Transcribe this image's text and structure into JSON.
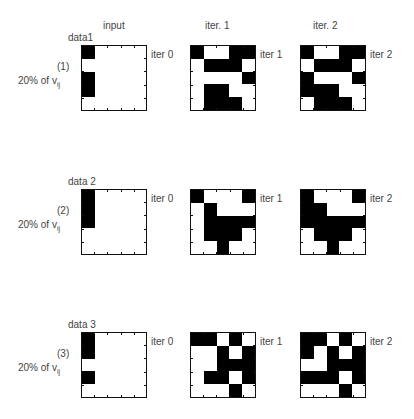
{
  "columns": {
    "input": "input",
    "iter1": "iter. 1",
    "iter2": "iter. 2"
  },
  "rows": [
    {
      "data_label": "data1",
      "case_label": "(1)",
      "percent_label": "20% of v",
      "percent_sub": "ij",
      "iter_labels": [
        "iter 0",
        "iter 1",
        "iter 2"
      ],
      "grids": [
        [
          [
            1,
            0,
            0,
            0,
            0
          ],
          [
            0,
            0,
            0,
            0,
            0
          ],
          [
            1,
            0,
            0,
            0,
            0
          ],
          [
            1,
            0,
            0,
            0,
            0
          ],
          [
            0,
            0,
            0,
            0,
            0
          ]
        ],
        [
          [
            1,
            0,
            0,
            1,
            1
          ],
          [
            0,
            1,
            1,
            1,
            0
          ],
          [
            0,
            0,
            0,
            0,
            1
          ],
          [
            0,
            1,
            1,
            0,
            0
          ],
          [
            0,
            1,
            1,
            1,
            0
          ]
        ],
        [
          [
            1,
            0,
            0,
            1,
            1
          ],
          [
            0,
            1,
            1,
            1,
            0
          ],
          [
            1,
            0,
            0,
            0,
            1
          ],
          [
            1,
            1,
            1,
            0,
            0
          ],
          [
            0,
            1,
            1,
            1,
            0
          ]
        ]
      ]
    },
    {
      "data_label": "data 2",
      "case_label": "(2)",
      "percent_label": "20% of v",
      "percent_sub": "ij",
      "iter_labels": [
        "iter 0",
        "iter 1",
        "iter 2"
      ],
      "grids": [
        [
          [
            1,
            0,
            0,
            0,
            0
          ],
          [
            1,
            0,
            0,
            0,
            0
          ],
          [
            1,
            0,
            0,
            0,
            0
          ],
          [
            0,
            0,
            0,
            0,
            0
          ],
          [
            0,
            0,
            0,
            0,
            0
          ]
        ],
        [
          [
            1,
            0,
            0,
            0,
            1
          ],
          [
            0,
            1,
            0,
            0,
            0
          ],
          [
            0,
            1,
            1,
            1,
            1
          ],
          [
            0,
            1,
            1,
            1,
            0
          ],
          [
            0,
            0,
            1,
            0,
            0
          ]
        ],
        [
          [
            1,
            0,
            0,
            0,
            1
          ],
          [
            1,
            1,
            0,
            0,
            0
          ],
          [
            1,
            1,
            1,
            1,
            1
          ],
          [
            0,
            1,
            1,
            1,
            0
          ],
          [
            0,
            0,
            1,
            0,
            0
          ]
        ]
      ]
    },
    {
      "data_label": "data 3",
      "case_label": "(3)",
      "percent_label": "20% of v",
      "percent_sub": "ij",
      "iter_labels": [
        "iter 0",
        "iter 1",
        "iter 2"
      ],
      "grids": [
        [
          [
            1,
            0,
            0,
            0,
            0
          ],
          [
            1,
            0,
            0,
            0,
            0
          ],
          [
            0,
            0,
            0,
            0,
            0
          ],
          [
            1,
            0,
            0,
            0,
            0
          ],
          [
            0,
            0,
            0,
            0,
            0
          ]
        ],
        [
          [
            1,
            1,
            0,
            1,
            0
          ],
          [
            0,
            0,
            1,
            0,
            1
          ],
          [
            0,
            0,
            1,
            1,
            1
          ],
          [
            0,
            1,
            1,
            0,
            1
          ],
          [
            0,
            0,
            0,
            1,
            0
          ]
        ],
        [
          [
            1,
            1,
            0,
            1,
            0
          ],
          [
            1,
            0,
            1,
            0,
            1
          ],
          [
            0,
            0,
            1,
            1,
            1
          ],
          [
            1,
            1,
            1,
            0,
            1
          ],
          [
            0,
            0,
            0,
            1,
            0
          ]
        ]
      ]
    }
  ]
}
